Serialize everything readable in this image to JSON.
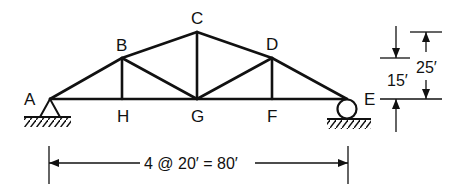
{
  "diagram": {
    "type": "truss",
    "nodes": {
      "A": "A",
      "B": "B",
      "C": "C",
      "D": "D",
      "E": "E",
      "F": "F",
      "G": "G",
      "H": "H"
    },
    "dimensions": {
      "span": "4 @ 20′ = 80′",
      "inner_height": "15′",
      "total_height": "25′"
    },
    "supports": {
      "left": "pin-support",
      "right": "roller-support"
    }
  }
}
